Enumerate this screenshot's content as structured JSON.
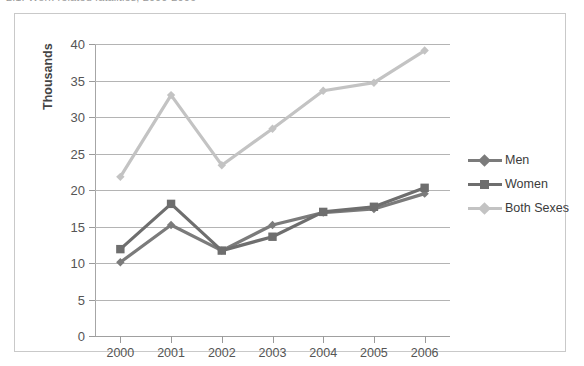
{
  "caption": {
    "text": "2.1. Work-related fatalities, 2000-2006"
  },
  "chart_data": {
    "type": "line",
    "title": "",
    "xlabel": "",
    "ylabel": "Thousands",
    "categories": [
      "2000",
      "2001",
      "2002",
      "2003",
      "2004",
      "2005",
      "2006"
    ],
    "ylim": [
      0,
      40
    ],
    "yticks": [
      0,
      5,
      10,
      15,
      20,
      25,
      30,
      35,
      40
    ],
    "grid": true,
    "legend_position": "right",
    "series": [
      {
        "name": "Men",
        "color": "#7b7b7b",
        "marker": "diamond",
        "values": [
          10.1,
          15.2,
          11.7,
          15.2,
          16.9,
          17.4,
          19.5
        ]
      },
      {
        "name": "Women",
        "color": "#6e6e6e",
        "marker": "square",
        "values": [
          11.9,
          18.1,
          11.7,
          13.6,
          17.0,
          17.7,
          20.3
        ]
      },
      {
        "name": "Both Sexes",
        "color": "#c3c3c3",
        "marker": "diamond",
        "values": [
          21.8,
          33.0,
          23.4,
          28.4,
          33.6,
          34.7,
          39.1
        ]
      }
    ]
  },
  "colors": {
    "frame": "#c9c9c9",
    "grid": "#b4b4b4",
    "axis": "#a0a0a0",
    "tick_text": "#555555"
  }
}
